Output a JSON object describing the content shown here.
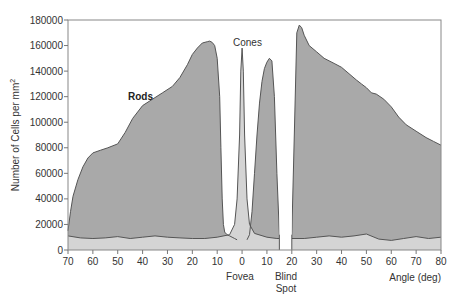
{
  "chart_data": {
    "type": "area",
    "title": "",
    "xlabel": "Angle (deg)",
    "ylabel": "Number of Cells per mm²",
    "ylabel_parts": {
      "main": "Number of Cells per mm",
      "sup": "2"
    },
    "xlim": [
      -70,
      80
    ],
    "ylim": [
      0,
      180000
    ],
    "x_tick_values": [
      -70,
      -60,
      -50,
      -40,
      -30,
      -20,
      -10,
      0,
      10,
      20,
      30,
      40,
      50,
      60,
      70,
      80
    ],
    "x_tick_labels": [
      "70",
      "60",
      "50",
      "40",
      "30",
      "20",
      "10",
      "0",
      "10",
      "20",
      "30",
      "40",
      "50",
      "60",
      "70",
      "80"
    ],
    "y_ticks": [
      0,
      20000,
      40000,
      60000,
      80000,
      100000,
      120000,
      140000,
      160000,
      180000
    ],
    "grid": false,
    "legend": null,
    "annotations": [
      {
        "text": "Rods",
        "x": -42,
        "y": 120000
      },
      {
        "text": "Cones",
        "x": 2,
        "y": 166000
      },
      {
        "text": "Fovea",
        "x": 0,
        "y": -22000,
        "below_axis": true
      },
      {
        "text": "Blind",
        "x": 17,
        "y": -22000,
        "below_axis": true
      },
      {
        "text": "Spot",
        "x": 17,
        "y": -31000,
        "below_axis": true
      }
    ],
    "blind_spot_range": [
      15,
      20
    ],
    "series": [
      {
        "name": "Rods",
        "color": "#a9a9a9",
        "segments": [
          {
            "x": [
              -70,
              -69,
              -68,
              -66,
              -64,
              -62,
              -60,
              -57,
              -54,
              -50,
              -47,
              -44,
              -40,
              -36,
              -32,
              -28,
              -25,
              -22,
              -20,
              -18,
              -16,
              -14,
              -13,
              -12,
              -11,
              -10,
              -9,
              -8.5,
              -8,
              -7.5,
              -7,
              -6,
              -5,
              -4,
              -3,
              -2
            ],
            "y": [
              15000,
              30000,
              42000,
              55000,
              65000,
              72000,
              76000,
              78000,
              80000,
              83000,
              92000,
              103000,
              113000,
              118000,
              123000,
              128000,
              135000,
              145000,
              153000,
              158000,
              162000,
              163000,
              163500,
              162500,
              160000,
              150000,
              120000,
              80000,
              40000,
              20000,
              14000,
              12000,
              11000,
              10000,
              9000,
              8000
            ]
          },
          {
            "x": [
              2,
              3,
              4,
              5,
              6,
              7,
              8,
              9,
              10,
              11,
              12,
              13,
              14,
              15
            ],
            "y": [
              8000,
              12000,
              30000,
              60000,
              90000,
              115000,
              132000,
              142000,
              147000,
              150000,
              148000,
              120000,
              60000,
              12000
            ]
          },
          {
            "x": [
              20,
              21,
              22,
              23,
              24,
              25,
              27,
              30,
              33,
              37,
              40,
              43,
              46,
              48,
              50,
              52,
              54,
              57,
              60,
              63,
              66,
              70,
              74,
              77,
              80
            ],
            "y": [
              12000,
              90000,
              170000,
              176000,
              174000,
              168000,
              160000,
              155000,
              150000,
              146000,
              143000,
              138000,
              133000,
              130000,
              127000,
              123000,
              122000,
              118000,
              112000,
              104000,
              98000,
              93000,
              88000,
              85000,
              82000
            ]
          }
        ]
      },
      {
        "name": "Cones",
        "color": "#d4d4d4",
        "segments": [
          {
            "x": [
              -70,
              -65,
              -60,
              -55,
              -50,
              -45,
              -40,
              -35,
              -30,
              -25,
              -20,
              -15,
              -10,
              -5,
              -3,
              -2,
              -1,
              -0.5,
              0,
              0.5,
              1,
              2,
              3,
              5,
              10,
              14,
              15
            ],
            "y": [
              11000,
              9500,
              9000,
              9500,
              10500,
              9000,
              10000,
              11000,
              10000,
              9500,
              9000,
              9000,
              10000,
              12000,
              20000,
              40000,
              90000,
              140000,
              158000,
              140000,
              90000,
              40000,
              20000,
              13000,
              10000,
              9000,
              9000
            ]
          },
          {
            "x": [
              20,
              25,
              30,
              35,
              40,
              45,
              50,
              55,
              60,
              65,
              70,
              75,
              80
            ],
            "y": [
              9000,
              9000,
              10000,
              11000,
              10000,
              11000,
              12500,
              8500,
              7500,
              9000,
              10500,
              9000,
              10000
            ]
          }
        ]
      }
    ]
  },
  "labels": {
    "rods": "Rods",
    "cones": "Cones",
    "fovea": "Fovea",
    "blind": "Blind",
    "spot": "Spot",
    "xlabel": "Angle (deg)",
    "ylabel_main": "Number of Cells per mm",
    "ylabel_sup": "2"
  },
  "colors": {
    "rods_fill": "#a9a9a9",
    "cones_fill": "#d4d4d4",
    "outline": "#555555",
    "axis": "#777777",
    "background": "#ffffff"
  }
}
